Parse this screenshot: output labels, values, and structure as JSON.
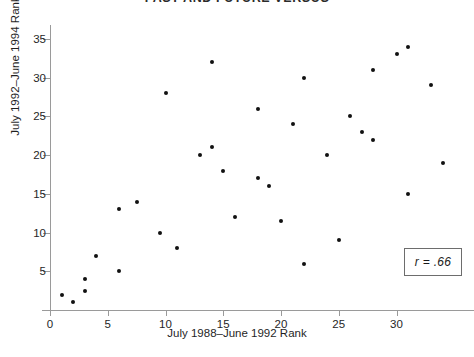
{
  "chart_data": {
    "type": "scatter",
    "title": "PAST AND FUTURE VERSUS",
    "xlabel": "July 1988–June 1992 Rank",
    "ylabel": "July 1992–June 1994 Rank",
    "xlim": [
      0,
      35
    ],
    "ylim": [
      0,
      35
    ],
    "xticks": [
      0,
      5,
      10,
      15,
      20,
      25,
      30
    ],
    "yticks": [
      5,
      10,
      15,
      20,
      25,
      30,
      35
    ],
    "grid": false,
    "legend_position": "bottom-right",
    "annotation": "r = .66",
    "correlation": 0.66,
    "series": [
      {
        "name": "Journals",
        "marker": "filled-circle",
        "color": "#111111",
        "points": [
          {
            "x": 1,
            "y": 2
          },
          {
            "x": 2,
            "y": 1
          },
          {
            "x": 3,
            "y": 2.5
          },
          {
            "x": 3,
            "y": 4
          },
          {
            "x": 4,
            "y": 7
          },
          {
            "x": 6,
            "y": 5
          },
          {
            "x": 6,
            "y": 13
          },
          {
            "x": 7.5,
            "y": 14
          },
          {
            "x": 9.5,
            "y": 10
          },
          {
            "x": 11,
            "y": 8
          },
          {
            "x": 10,
            "y": 28
          },
          {
            "x": 13,
            "y": 20
          },
          {
            "x": 14,
            "y": 21
          },
          {
            "x": 14,
            "y": 32
          },
          {
            "x": 15,
            "y": 18
          },
          {
            "x": 16,
            "y": 12
          },
          {
            "x": 18,
            "y": 26
          },
          {
            "x": 18,
            "y": 17
          },
          {
            "x": 19,
            "y": 16
          },
          {
            "x": 20,
            "y": 11.5
          },
          {
            "x": 22,
            "y": 6
          },
          {
            "x": 21,
            "y": 24
          },
          {
            "x": 22,
            "y": 30
          },
          {
            "x": 24,
            "y": 20
          },
          {
            "x": 25,
            "y": 9
          },
          {
            "x": 26,
            "y": 25
          },
          {
            "x": 27,
            "y": 23
          },
          {
            "x": 28,
            "y": 31
          },
          {
            "x": 28,
            "y": 22
          },
          {
            "x": 30,
            "y": 33
          },
          {
            "x": 31,
            "y": 34
          },
          {
            "x": 31,
            "y": 15
          },
          {
            "x": 33,
            "y": 29
          },
          {
            "x": 34,
            "y": 19
          }
        ]
      }
    ]
  }
}
